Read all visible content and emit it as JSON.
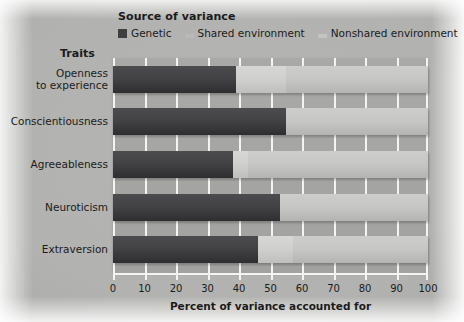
{
  "chart_data": {
    "type": "bar",
    "orientation": "horizontal",
    "stacked": true,
    "title": "",
    "legend_title": "Source of variance",
    "legend_position": "top",
    "xlabel": "Percent of variance accounted for",
    "ylabel": "Traits",
    "xlim": [
      0,
      100
    ],
    "xticks": [
      0,
      10,
      20,
      30,
      40,
      50,
      60,
      70,
      80,
      90,
      100
    ],
    "xticklabels": [
      "0",
      "10",
      "20",
      "30",
      "40",
      "50",
      "60",
      "70",
      "80",
      "90",
      "100"
    ],
    "grid": true,
    "categories": [
      "Openness to experience",
      "Conscientiousness",
      "Agreeableness",
      "Neuroticism",
      "Extraversion"
    ],
    "series": [
      {
        "name": "Genetic",
        "color": "#3f3f41",
        "values": [
          39,
          55,
          38,
          53,
          46
        ]
      },
      {
        "name": "Shared environment",
        "color": "#cfcfcd",
        "values": [
          16,
          0,
          5,
          0,
          11
        ]
      },
      {
        "name": "Nonshared environment",
        "color": "#c0c0be",
        "values": [
          45,
          45,
          57,
          47,
          43
        ]
      }
    ]
  },
  "legend": {
    "title": "Source of variance",
    "items": [
      {
        "label": "Genetic",
        "swatch": "genetic-swatch"
      },
      {
        "label": "Shared environment",
        "swatch": "shared-environment-swatch"
      },
      {
        "label": "Nonshared environment",
        "swatch": "nonshared-environment-swatch"
      }
    ]
  },
  "axes": {
    "y_title": "Traits",
    "x_title": "Percent of variance accounted for"
  },
  "colors": {
    "genetic": "#3f3f41",
    "shared": "#cfcfcd",
    "nonshared": "#c0c0be",
    "plot_background": "#a5a5a3",
    "gridline": "#f4f4f2",
    "page_background": "#b2b2b0",
    "text": "#1b1b1b"
  }
}
